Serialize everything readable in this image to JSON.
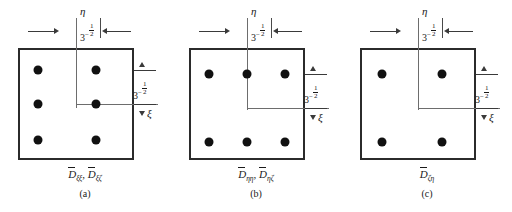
{
  "figure": {
    "dimension_value": "3",
    "dimension_exponent_sign": "-",
    "dimension_exponent_num": "1",
    "dimension_exponent_den": "2",
    "axis_eta": "η",
    "axis_xi": "ξ",
    "ink_color": "#1a1a1a",
    "line_color": "#2b2b2b",
    "axis_color": "#6d6d6d",
    "dot_color": "#111111"
  },
  "panels": [
    {
      "id": "a",
      "caption_letter": "(a)",
      "formula_parts": [
        {
          "base": "D",
          "sub": "ξξ"
        },
        {
          "base": "D",
          "sub": "ξζ"
        }
      ],
      "grid": {
        "cols": 2,
        "rows": 3
      },
      "points": [
        {
          "x": 38,
          "y": 70
        },
        {
          "x": 96,
          "y": 70
        },
        {
          "x": 38,
          "y": 104
        },
        {
          "x": 96,
          "y": 104
        },
        {
          "x": 38,
          "y": 140
        },
        {
          "x": 96,
          "y": 140
        }
      ],
      "eta_axis_x": 76,
      "xi_axis_y": 104
    },
    {
      "id": "b",
      "caption_letter": "(b)",
      "formula_parts": [
        {
          "base": "D",
          "sub": "ηη"
        },
        {
          "base": "D",
          "sub": "ηζ"
        }
      ],
      "grid": {
        "cols": 3,
        "rows": 2
      },
      "points": [
        {
          "x": 38,
          "y": 74
        },
        {
          "x": 76,
          "y": 74
        },
        {
          "x": 114,
          "y": 74
        },
        {
          "x": 38,
          "y": 142
        },
        {
          "x": 76,
          "y": 142
        },
        {
          "x": 114,
          "y": 142
        }
      ],
      "eta_axis_x": 76,
      "xi_axis_y": 108
    },
    {
      "id": "c",
      "caption_letter": "(c)",
      "formula_parts": [
        {
          "base": "D",
          "sub": "ζη"
        }
      ],
      "grid": {
        "cols": 2,
        "rows": 2
      },
      "points": [
        {
          "x": 40,
          "y": 74
        },
        {
          "x": 100,
          "y": 74
        },
        {
          "x": 40,
          "y": 142
        },
        {
          "x": 100,
          "y": 142
        }
      ],
      "eta_axis_x": 76,
      "xi_axis_y": 108
    }
  ]
}
